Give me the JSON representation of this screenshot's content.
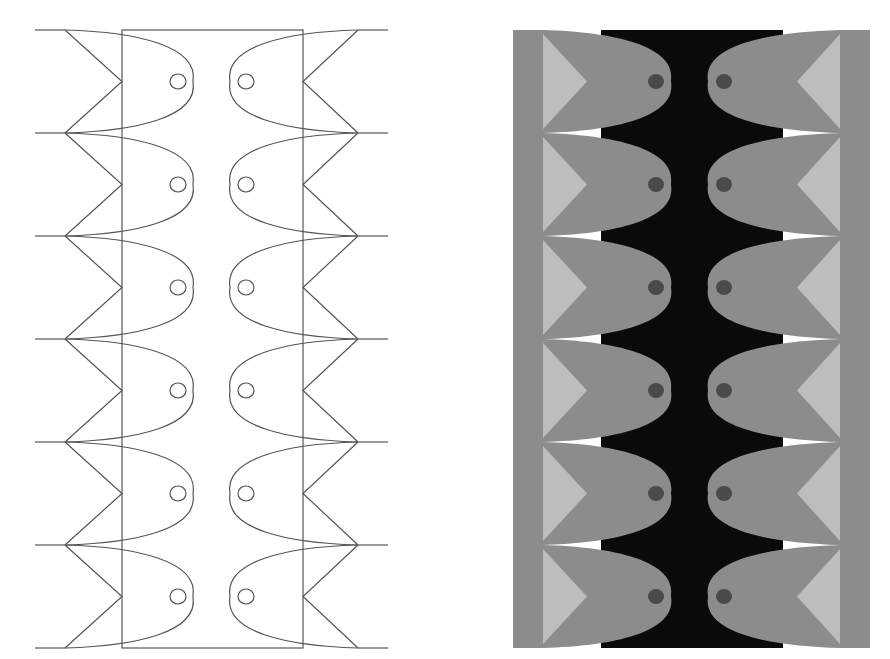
{
  "figure": {
    "rows": 6,
    "row_tops": [
      30,
      133,
      236,
      339,
      442,
      545
    ],
    "row_height": 103,
    "bottom": 648
  },
  "line_drawing": {
    "outer_left": 35,
    "outer_right": 388,
    "rect_left": 122,
    "rect_right": 303,
    "tail_left_x": 65,
    "tail_right_x": 358,
    "nose_left_x": 193,
    "nose_right_x": 230,
    "eye_left_x": 178,
    "eye_right_x": 246,
    "stroke": "#555555"
  },
  "filled_drawing": {
    "outer_left": 513,
    "outer_right": 870,
    "rect_left": 601,
    "rect_right": 783,
    "tail_left_x": 543,
    "tail_right_x": 840,
    "nose_left_x": 671,
    "nose_right_x": 708,
    "eye_left_x": 656,
    "eye_right_x": 724,
    "colors": {
      "background_band": "#0a0a0a",
      "fish_body": "#8c8c8c",
      "tail_fill": "#bdbdbd",
      "eye": "#4a4a4a",
      "gap": "#ffffff"
    }
  }
}
